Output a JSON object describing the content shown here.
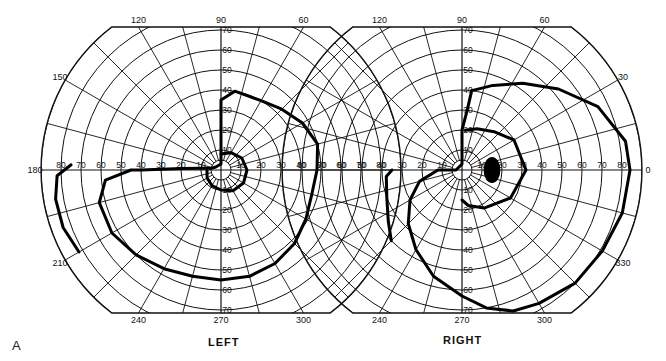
{
  "figure": {
    "letter": "A",
    "panels": [
      {
        "id": "left",
        "label": "LEFT",
        "center": [
          221,
          170
        ]
      },
      {
        "id": "right",
        "label": "RIGHT",
        "center": [
          462,
          170
        ]
      }
    ],
    "meridian_labels": [
      "0",
      "30",
      "60",
      "90",
      "120",
      "150",
      "180",
      "210",
      "240",
      "270",
      "300",
      "330"
    ],
    "ring_labels": [
      "10",
      "20",
      "30",
      "40",
      "50",
      "60",
      "70",
      "80"
    ]
  },
  "chart_data": {
    "type": "polar-perimetry",
    "panels": [
      "LEFT",
      "RIGHT"
    ],
    "angular_axis": {
      "unit": "degrees",
      "major_ticks": [
        0,
        30,
        60,
        90,
        120,
        150,
        180,
        210,
        240,
        270,
        300,
        330
      ],
      "minor_step": 15
    },
    "radial_axis": {
      "unit": "degrees eccentricity",
      "range": [
        0,
        90
      ],
      "rings": [
        5,
        10,
        20,
        30,
        40,
        50,
        60,
        70,
        80,
        90
      ]
    },
    "series": [
      {
        "name": "LEFT outer isopter",
        "panel": "LEFT",
        "points_deg_ecc": [
          [
            90,
            35
          ],
          [
            80,
            40
          ],
          [
            60,
            40
          ],
          [
            45,
            43
          ],
          [
            30,
            47
          ],
          [
            15,
            50
          ],
          [
            0,
            48
          ],
          [
            -15,
            47
          ],
          [
            -30,
            49
          ],
          [
            -45,
            52
          ],
          [
            -60,
            54
          ],
          [
            -75,
            55
          ],
          [
            -90,
            55
          ],
          [
            -105,
            55
          ],
          [
            -120,
            57
          ],
          [
            -135,
            60
          ],
          [
            -150,
            63
          ],
          [
            -165,
            63
          ],
          [
            -175,
            58
          ],
          [
            180,
            45
          ],
          [
            180,
            40
          ],
          [
            178,
            20
          ],
          [
            175,
            10
          ],
          [
            170,
            5
          ],
          [
            150,
            3
          ],
          [
            90,
            3
          ],
          [
            90,
            35
          ]
        ]
      },
      {
        "name": "LEFT far-temporal isopter",
        "panel": "LEFT",
        "points_deg_ecc": [
          [
            178,
            75
          ],
          [
            182,
            82
          ],
          [
            190,
            84
          ],
          [
            200,
            84
          ],
          [
            210,
            82
          ]
        ]
      },
      {
        "name": "LEFT inner isopter",
        "panel": "LEFT",
        "points_deg_ecc": [
          [
            90,
            8
          ],
          [
            60,
            10
          ],
          [
            30,
            12
          ],
          [
            0,
            13
          ],
          [
            -30,
            13
          ],
          [
            -60,
            12
          ],
          [
            -90,
            10
          ],
          [
            -120,
            9
          ],
          [
            -150,
            8
          ],
          [
            180,
            7
          ]
        ]
      },
      {
        "name": "RIGHT outer isopter",
        "panel": "RIGHT",
        "points_deg_ecc": [
          [
            83,
            40
          ],
          [
            70,
            45
          ],
          [
            55,
            53
          ],
          [
            40,
            63
          ],
          [
            25,
            75
          ],
          [
            10,
            83
          ],
          [
            0,
            84
          ],
          [
            -15,
            83
          ],
          [
            -30,
            81
          ],
          [
            -45,
            80
          ],
          [
            -60,
            77
          ],
          [
            -70,
            75
          ],
          [
            -80,
            70
          ],
          [
            -90,
            63
          ],
          [
            -105,
            55
          ],
          [
            -120,
            46
          ],
          [
            -135,
            38
          ],
          [
            -150,
            30
          ],
          [
            -165,
            22
          ],
          [
            180,
            12
          ],
          [
            180,
            3
          ],
          [
            90,
            3
          ],
          [
            90,
            20
          ],
          [
            85,
            30
          ],
          [
            83,
            40
          ]
        ]
      },
      {
        "name": "RIGHT nasal step",
        "panel": "RIGHT",
        "points_deg_ecc": [
          [
            180,
            35
          ],
          [
            185,
            38
          ],
          [
            200,
            40
          ],
          [
            215,
            45
          ],
          [
            225,
            50
          ]
        ]
      },
      {
        "name": "RIGHT inner isopter",
        "panel": "RIGHT",
        "points_deg_ecc": [
          [
            85,
            20
          ],
          [
            70,
            22
          ],
          [
            50,
            25
          ],
          [
            30,
            30
          ],
          [
            0,
            32
          ],
          [
            -30,
            28
          ],
          [
            -60,
            22
          ],
          [
            -80,
            18
          ],
          [
            -90,
            15
          ]
        ]
      },
      {
        "name": "RIGHT blind spot",
        "panel": "RIGHT",
        "type": "filled-ellipse",
        "center_deg_ecc": [
          0,
          15
        ],
        "size_deg": [
          6,
          10
        ]
      }
    ]
  }
}
